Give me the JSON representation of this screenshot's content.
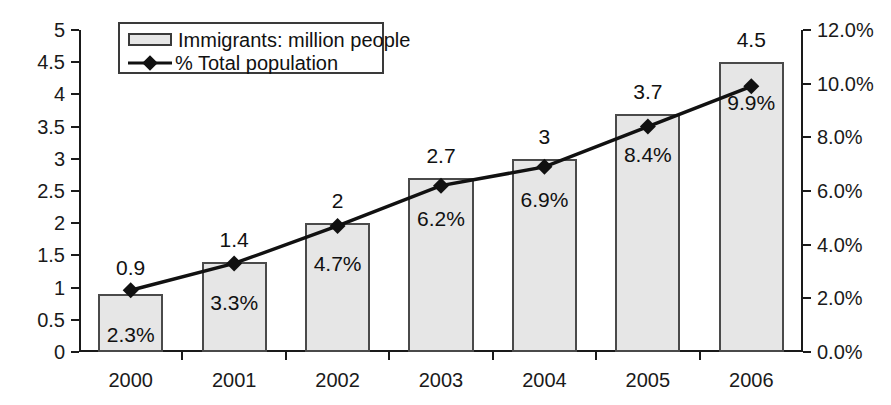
{
  "chart_data": {
    "type": "bar",
    "title": "",
    "subtitle": "",
    "xlabel": "",
    "ylabel": "",
    "categories": [
      "2000",
      "2001",
      "2002",
      "2003",
      "2004",
      "2005",
      "2006"
    ],
    "grid": false,
    "legend_position": "top-left",
    "axes": {
      "left": {
        "label": "",
        "min": 0,
        "max": 5,
        "step": 0.5,
        "ticks": [
          "0",
          "0.5",
          "1",
          "1.5",
          "2",
          "2.5",
          "3",
          "3.5",
          "4",
          "4.5",
          "5"
        ],
        "tick_values": [
          0,
          0.5,
          1,
          1.5,
          2,
          2.5,
          3,
          3.5,
          4,
          4.5,
          5
        ]
      },
      "right": {
        "label": "",
        "min": 0,
        "max": 12,
        "step": 2,
        "ticks": [
          "0.0%",
          "2.0%",
          "4.0%",
          "6.0%",
          "8.0%",
          "10.0%",
          "12.0%"
        ],
        "tick_values": [
          0,
          2,
          4,
          6,
          8,
          10,
          12
        ]
      }
    },
    "series": [
      {
        "name": "Immigrants: million people",
        "kind": "bar",
        "axis": "left",
        "color": "#e6e6e6",
        "edge_color": "#4a4a4a",
        "values": [
          0.9,
          1.4,
          2,
          2.7,
          3,
          3.7,
          4.5
        ],
        "value_labels": [
          "0.9",
          "1.4",
          "2",
          "2.7",
          "3",
          "3.7",
          "4.5"
        ]
      },
      {
        "name": "% Total population",
        "kind": "line",
        "axis": "right",
        "color": "#111111",
        "marker": "diamond",
        "values": [
          2.3,
          3.3,
          4.7,
          6.2,
          6.9,
          8.4,
          9.9
        ],
        "value_labels": [
          "2.3%",
          "3.3%",
          "4.7%",
          "6.2%",
          "6.9%",
          "8.4%",
          "9.9%"
        ]
      }
    ]
  },
  "legend": {
    "items": [
      {
        "label": "Immigrants: million people",
        "swatch": "bar-swatch"
      },
      {
        "label": "% Total population",
        "swatch": "line-diamond-swatch"
      }
    ]
  }
}
